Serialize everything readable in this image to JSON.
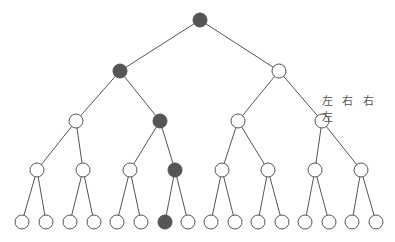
{
  "diagram": {
    "type": "binary-tree",
    "depth": 5,
    "path_label": "左 右 右 左",
    "colors": {
      "filled": "#555555",
      "empty": "#ffffff",
      "stroke": "#555555"
    },
    "nodes": [
      {
        "id": "n0",
        "x": 200,
        "y": 20,
        "filled": true
      },
      {
        "id": "n1",
        "x": 120,
        "y": 71,
        "filled": true
      },
      {
        "id": "n2",
        "x": 279,
        "y": 71,
        "filled": false
      },
      {
        "id": "n3",
        "x": 76,
        "y": 121,
        "filled": false
      },
      {
        "id": "n4",
        "x": 160,
        "y": 121,
        "filled": true
      },
      {
        "id": "n5",
        "x": 238,
        "y": 121,
        "filled": false
      },
      {
        "id": "n6",
        "x": 322,
        "y": 121,
        "filled": false
      },
      {
        "id": "n7",
        "x": 37,
        "y": 170,
        "filled": false
      },
      {
        "id": "n8",
        "x": 83,
        "y": 170,
        "filled": false
      },
      {
        "id": "n9",
        "x": 130,
        "y": 170,
        "filled": false
      },
      {
        "id": "n10",
        "x": 175,
        "y": 170,
        "filled": true
      },
      {
        "id": "n11",
        "x": 222,
        "y": 170,
        "filled": false
      },
      {
        "id": "n12",
        "x": 268,
        "y": 170,
        "filled": false
      },
      {
        "id": "n13",
        "x": 315,
        "y": 170,
        "filled": false
      },
      {
        "id": "n14",
        "x": 361,
        "y": 170,
        "filled": false
      },
      {
        "id": "n15",
        "x": 22,
        "y": 222,
        "filled": false
      },
      {
        "id": "n16",
        "x": 46,
        "y": 222,
        "filled": false
      },
      {
        "id": "n17",
        "x": 70,
        "y": 222,
        "filled": false
      },
      {
        "id": "n18",
        "x": 94,
        "y": 222,
        "filled": false
      },
      {
        "id": "n19",
        "x": 117,
        "y": 222,
        "filled": false
      },
      {
        "id": "n20",
        "x": 141,
        "y": 222,
        "filled": false
      },
      {
        "id": "n21",
        "x": 165,
        "y": 222,
        "filled": true
      },
      {
        "id": "n22",
        "x": 188,
        "y": 222,
        "filled": false
      },
      {
        "id": "n23",
        "x": 211,
        "y": 222,
        "filled": false
      },
      {
        "id": "n24",
        "x": 235,
        "y": 222,
        "filled": false
      },
      {
        "id": "n25",
        "x": 258,
        "y": 222,
        "filled": false
      },
      {
        "id": "n26",
        "x": 282,
        "y": 222,
        "filled": false
      },
      {
        "id": "n27",
        "x": 305,
        "y": 222,
        "filled": false
      },
      {
        "id": "n28",
        "x": 329,
        "y": 222,
        "filled": false
      },
      {
        "id": "n29",
        "x": 352,
        "y": 222,
        "filled": false
      },
      {
        "id": "n30",
        "x": 376,
        "y": 222,
        "filled": false
      }
    ]
  }
}
